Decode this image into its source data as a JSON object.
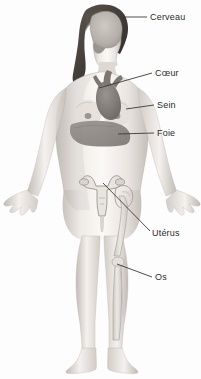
{
  "diagram": {
    "background_color": "#fdfdfd",
    "line_color": "#3a3a3a",
    "text_color": "#2b2b2b",
    "skin_color": "#e9e4df",
    "hair_color": "#4a4440",
    "organ_color": "#8d8d8d",
    "bone_color": "#d8d6d2"
  },
  "labels": [
    {
      "id": "cerveau",
      "text": "Cerveau",
      "organ": "brain",
      "x": 150,
      "y": 12,
      "leader": {
        "x1": 120,
        "y1": 17,
        "x2": 147,
        "y2": 17
      }
    },
    {
      "id": "coeur",
      "text": "Cœur",
      "organ": "heart",
      "x": 155,
      "y": 68,
      "leader": {
        "x1": 99,
        "y1": 88,
        "x2": 152,
        "y2": 73
      }
    },
    {
      "id": "sein",
      "text": "Sein",
      "organ": "breast",
      "x": 157,
      "y": 100,
      "leader": {
        "x1": 126,
        "y1": 109,
        "x2": 154,
        "y2": 105
      }
    },
    {
      "id": "foie",
      "text": "Foie",
      "organ": "liver",
      "x": 157,
      "y": 128,
      "leader": {
        "x1": 118,
        "y1": 134,
        "x2": 154,
        "y2": 133
      }
    },
    {
      "id": "uterus",
      "text": "Utérus",
      "organ": "uterus",
      "x": 152,
      "y": 228,
      "leader": {
        "x1": 103,
        "y1": 183,
        "x2": 150,
        "y2": 231
      }
    },
    {
      "id": "os",
      "text": "Os",
      "organ": "bone",
      "x": 155,
      "y": 272,
      "leader": {
        "x1": 117,
        "y1": 264,
        "x2": 152,
        "y2": 277
      }
    }
  ]
}
